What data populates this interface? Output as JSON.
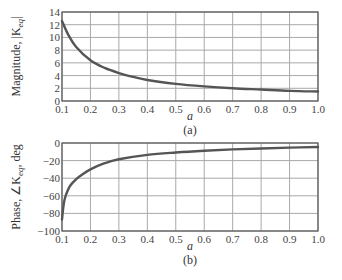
{
  "chart_data": [
    {
      "type": "line",
      "panel_label": "(a)",
      "title": "",
      "xlabel": "a",
      "ylabel_prefix": "Magnitude, |K",
      "ylabel_sub": "eq",
      "ylabel_suffix": "|",
      "xlim": [
        0.1,
        1.0
      ],
      "ylim": [
        0,
        14
      ],
      "grid": true,
      "x_ticks": [
        0.1,
        0.2,
        0.3,
        0.4,
        0.5,
        0.6,
        0.7,
        0.8,
        0.9,
        1.0
      ],
      "x_tick_labels": [
        "0.1",
        "0.2",
        "0.3",
        "0.4",
        "0.5",
        "0.6",
        "0.7",
        "0.8",
        "0.9",
        "1.0"
      ],
      "y_ticks": [
        0,
        2,
        4,
        6,
        8,
        10,
        12,
        14
      ],
      "y_tick_labels": [
        "0",
        "2",
        "4",
        "6",
        "8",
        "10",
        "12",
        "14"
      ],
      "series": [
        {
          "name": "|K_eq|",
          "x": [
            0.1,
            0.12,
            0.15,
            0.2,
            0.25,
            0.3,
            0.35,
            0.4,
            0.5,
            0.6,
            0.7,
            0.8,
            0.9,
            1.0
          ],
          "y": [
            12.6,
            10.6,
            8.5,
            6.4,
            5.2,
            4.4,
            3.8,
            3.3,
            2.7,
            2.3,
            2.0,
            1.8,
            1.6,
            1.5
          ]
        }
      ]
    },
    {
      "type": "line",
      "panel_label": "(b)",
      "title": "",
      "xlabel": "a",
      "ylabel_prefix": "Phase, ∠K",
      "ylabel_sub": "eq",
      "ylabel_suffix": ", deg",
      "xlim": [
        0.1,
        1.0
      ],
      "ylim": [
        -100,
        0
      ],
      "grid": true,
      "x_ticks": [
        0.1,
        0.2,
        0.3,
        0.4,
        0.5,
        0.6,
        0.7,
        0.8,
        0.9,
        1.0
      ],
      "x_tick_labels": [
        "0.1",
        "0.2",
        "0.3",
        "0.4",
        "0.5",
        "0.6",
        "0.7",
        "0.8",
        "0.9",
        "1.0"
      ],
      "y_ticks": [
        0,
        -20,
        -40,
        -60,
        -80,
        -100
      ],
      "y_tick_labels": [
        "0",
        "−20",
        "−40",
        "−60",
        "−80",
        "−100"
      ],
      "series": [
        {
          "name": "∠K_eq",
          "x": [
            0.1,
            0.105,
            0.11,
            0.12,
            0.13,
            0.15,
            0.17,
            0.2,
            0.25,
            0.3,
            0.4,
            0.5,
            0.6,
            0.7,
            0.8,
            0.9,
            1.0
          ],
          "y": [
            -87,
            -72,
            -63,
            -54,
            -48,
            -41,
            -36,
            -30,
            -23,
            -18.5,
            -13.5,
            -10.8,
            -8.8,
            -7.3,
            -6.2,
            -5.3,
            -4.6
          ]
        }
      ]
    }
  ]
}
